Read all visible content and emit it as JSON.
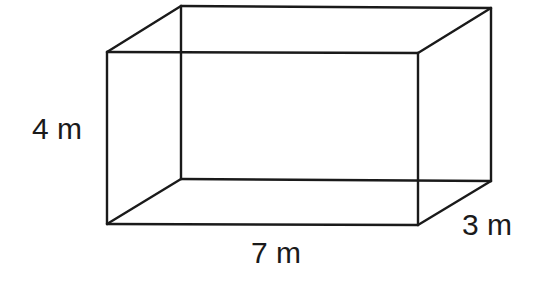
{
  "diagram": {
    "type": "rectangular-prism",
    "stroke_color": "#1a1a1a",
    "background_color": "#ffffff",
    "vertices": {
      "front_top_left": [
        107,
        52
      ],
      "front_top_right": [
        418,
        53
      ],
      "front_bottom_left": [
        107,
        224
      ],
      "front_bottom_right": [
        418,
        225
      ],
      "back_top_left": [
        181,
        6
      ],
      "back_top_right": [
        491,
        8
      ],
      "back_bottom_left": [
        181,
        179
      ],
      "back_bottom_right": [
        491,
        181
      ]
    },
    "labels": {
      "height": "4 m",
      "length": "7 m",
      "width": "3 m"
    }
  }
}
